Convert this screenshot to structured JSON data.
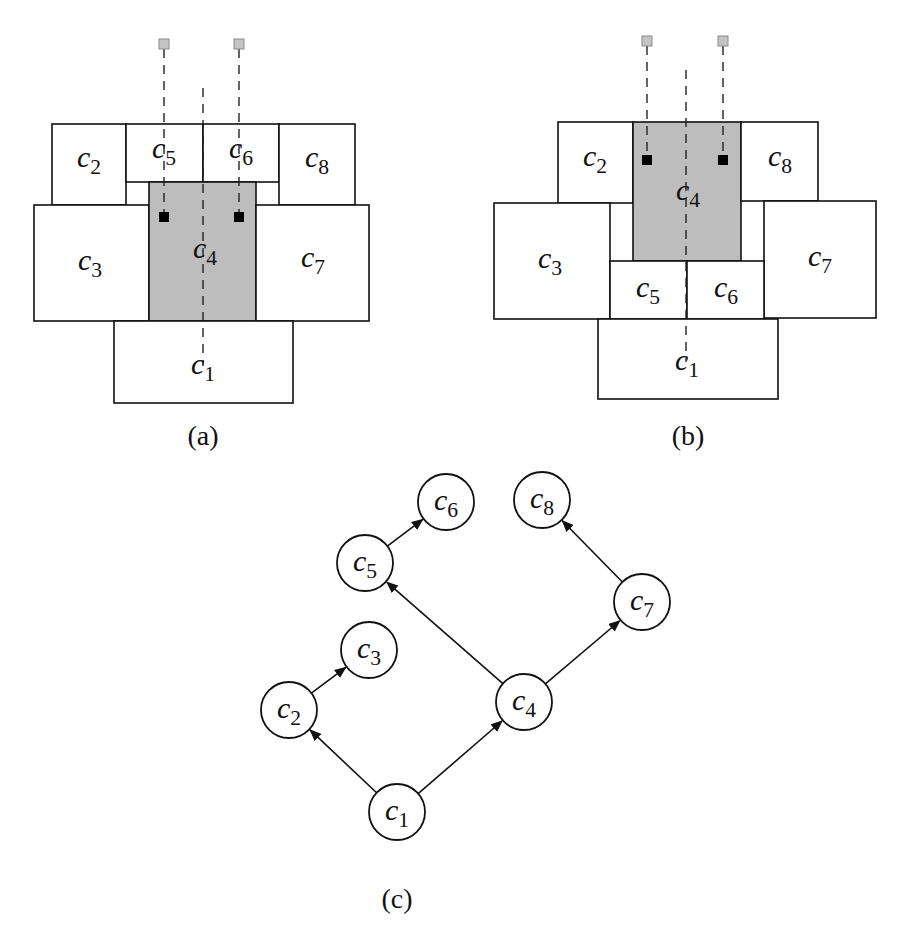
{
  "figure": {
    "panels": [
      {
        "id": "a",
        "caption": "(a)",
        "caption_pos": [
          203,
          445
        ],
        "cells": [
          {
            "name": "c",
            "sub": "2",
            "x": 52,
            "y": 124,
            "w": 74,
            "h": 81,
            "shaded": false,
            "lx": 89,
            "ly": 167
          },
          {
            "name": "c",
            "sub": "5",
            "x": 126,
            "y": 124,
            "w": 77,
            "h": 58,
            "shaded": false,
            "lx": 164,
            "ly": 158
          },
          {
            "name": "c",
            "sub": "6",
            "x": 203,
            "y": 124,
            "w": 76,
            "h": 58,
            "shaded": false,
            "lx": 241,
            "ly": 158
          },
          {
            "name": "c",
            "sub": "8",
            "x": 279,
            "y": 124,
            "w": 76,
            "h": 81,
            "shaded": false,
            "lx": 317,
            "ly": 167
          },
          {
            "name": "c",
            "sub": "3",
            "x": 34,
            "y": 205,
            "w": 115,
            "h": 116,
            "shaded": false,
            "lx": 90,
            "ly": 270
          },
          {
            "name": "c",
            "sub": "4",
            "x": 149,
            "y": 182,
            "w": 107,
            "h": 139,
            "shaded": true,
            "lx": 205,
            "ly": 258
          },
          {
            "name": "c",
            "sub": "7",
            "x": 256,
            "y": 205,
            "w": 113,
            "h": 116,
            "shaded": false,
            "lx": 313,
            "ly": 267
          },
          {
            "name": "c",
            "sub": "1",
            "x": 114,
            "y": 321,
            "w": 179,
            "h": 82,
            "shaded": false,
            "lx": 203,
            "ly": 374
          }
        ],
        "pins": [
          {
            "x": 164,
            "y": 44
          },
          {
            "x": 239,
            "y": 44
          }
        ],
        "ports": [
          {
            "x": 164,
            "y": 217
          },
          {
            "x": 239,
            "y": 217
          }
        ],
        "center_line": {
          "x": 203,
          "y1": 88,
          "y2": 366
        }
      },
      {
        "id": "b",
        "caption": "(b)",
        "caption_pos": [
          688,
          445
        ],
        "cells": [
          {
            "name": "c",
            "sub": "2",
            "x": 558,
            "y": 122,
            "w": 75,
            "h": 81,
            "shaded": false,
            "lx": 595,
            "ly": 166
          },
          {
            "name": "c",
            "sub": "4",
            "x": 633,
            "y": 122,
            "w": 108,
            "h": 139,
            "shaded": true,
            "lx": 688,
            "ly": 200
          },
          {
            "name": "c",
            "sub": "8",
            "x": 741,
            "y": 122,
            "w": 77,
            "h": 79,
            "shaded": false,
            "lx": 780,
            "ly": 166
          },
          {
            "name": "c",
            "sub": "3",
            "x": 494,
            "y": 203,
            "w": 116,
            "h": 116,
            "shaded": false,
            "lx": 550,
            "ly": 268
          },
          {
            "name": "c",
            "sub": "7",
            "x": 764,
            "y": 201,
            "w": 112,
            "h": 117,
            "shaded": false,
            "lx": 820,
            "ly": 266
          },
          {
            "name": "c",
            "sub": "5",
            "x": 610,
            "y": 261,
            "w": 77,
            "h": 58,
            "shaded": false,
            "lx": 648,
            "ly": 297
          },
          {
            "name": "c",
            "sub": "6",
            "x": 687,
            "y": 261,
            "w": 77,
            "h": 58,
            "shaded": false,
            "lx": 726,
            "ly": 297
          },
          {
            "name": "c",
            "sub": "1",
            "x": 598,
            "y": 319,
            "w": 180,
            "h": 80,
            "shaded": false,
            "lx": 687,
            "ly": 370
          }
        ],
        "pins": [
          {
            "x": 647,
            "y": 41
          },
          {
            "x": 723,
            "y": 41
          }
        ],
        "ports": [
          {
            "x": 647,
            "y": 160
          },
          {
            "x": 723,
            "y": 160
          }
        ],
        "center_line": {
          "x": 686,
          "y1": 70,
          "y2": 362
        }
      }
    ],
    "graph": {
      "id": "c",
      "caption": "(c)",
      "caption_pos": [
        397,
        908
      ],
      "node_radius": 28,
      "nodes": [
        {
          "id": "c1",
          "name": "c",
          "sub": "1",
          "x": 397,
          "y": 812
        },
        {
          "id": "c2",
          "name": "c",
          "sub": "2",
          "x": 289,
          "y": 710
        },
        {
          "id": "c3",
          "name": "c",
          "sub": "3",
          "x": 369,
          "y": 650
        },
        {
          "id": "c4",
          "name": "c",
          "sub": "4",
          "x": 524,
          "y": 702
        },
        {
          "id": "c5",
          "name": "c",
          "sub": "5",
          "x": 365,
          "y": 563
        },
        {
          "id": "c6",
          "name": "c",
          "sub": "6",
          "x": 446,
          "y": 502
        },
        {
          "id": "c7",
          "name": "c",
          "sub": "7",
          "x": 642,
          "y": 602
        },
        {
          "id": "c8",
          "name": "c",
          "sub": "8",
          "x": 542,
          "y": 500
        }
      ],
      "edges": [
        {
          "from": "c1",
          "to": "c2"
        },
        {
          "from": "c1",
          "to": "c4"
        },
        {
          "from": "c2",
          "to": "c3"
        },
        {
          "from": "c4",
          "to": "c5"
        },
        {
          "from": "c4",
          "to": "c7"
        },
        {
          "from": "c5",
          "to": "c6"
        },
        {
          "from": "c7",
          "to": "c8"
        }
      ]
    }
  }
}
